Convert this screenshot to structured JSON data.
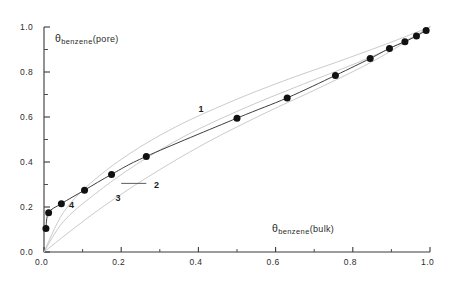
{
  "figure": {
    "background_color": "#ffffff",
    "axis_color": "#3a3a3a",
    "marker_color": "#111111",
    "data_curve_color": "#3d3d3d",
    "theory_curve_color": "#b9b9b9"
  },
  "labels": {
    "y_axis": {
      "theta": "θ",
      "subscript": "benzene",
      "paren": "(pore)"
    },
    "x_axis": {
      "theta": "θ",
      "subscript": "benzene",
      "paren": "(bulk)"
    }
  },
  "chart_data": {
    "type": "scatter",
    "title": "",
    "xlabel": "θ benzene (bulk)",
    "ylabel": "θ benzene (pore)",
    "xlim": [
      0.0,
      1.0
    ],
    "ylim": [
      0.0,
      1.0
    ],
    "grid": false,
    "legend": "none",
    "x_ticks": [
      0.0,
      0.2,
      0.4,
      0.6,
      0.8,
      1.0
    ],
    "x_tick_labels": [
      "0.0",
      "0.2",
      "0.4",
      "0.6",
      "0.8",
      "1.0"
    ],
    "y_ticks": [
      0.0,
      0.2,
      0.4,
      0.6,
      0.8,
      1.0
    ],
    "y_tick_labels": [
      "0.0",
      "0.2",
      "0.4",
      "0.6",
      "0.8",
      "1.0"
    ],
    "x_minor_ticks": [
      0.1,
      0.3,
      0.5,
      0.7,
      0.9
    ],
    "y_minor_ticks": [
      0.1,
      0.3,
      0.5,
      0.7,
      0.9
    ],
    "annotations": [
      {
        "text": "1",
        "x": 0.4,
        "y": 0.63
      },
      {
        "text": "2",
        "x": 0.285,
        "y": 0.295
      },
      {
        "text": "3",
        "x": 0.185,
        "y": 0.235
      },
      {
        "text": "4",
        "x": 0.065,
        "y": 0.205
      }
    ],
    "series": [
      {
        "name": "4",
        "label": "simulation data",
        "type": "scatter+line",
        "marker": "filled-circle",
        "points": [
          {
            "x": 0.005,
            "y": 0.105
          },
          {
            "x": 0.012,
            "y": 0.175
          },
          {
            "x": 0.045,
            "y": 0.215
          },
          {
            "x": 0.105,
            "y": 0.275
          },
          {
            "x": 0.175,
            "y": 0.345
          },
          {
            "x": 0.265,
            "y": 0.425
          },
          {
            "x": 0.5,
            "y": 0.595
          },
          {
            "x": 0.63,
            "y": 0.685
          },
          {
            "x": 0.755,
            "y": 0.785
          },
          {
            "x": 0.845,
            "y": 0.86
          },
          {
            "x": 0.895,
            "y": 0.905
          },
          {
            "x": 0.935,
            "y": 0.935
          },
          {
            "x": 0.965,
            "y": 0.96
          },
          {
            "x": 0.99,
            "y": 0.985
          }
        ]
      },
      {
        "name": "1",
        "label": "theory curve 1",
        "type": "line",
        "style": "faint",
        "points": [
          {
            "x": 0.0,
            "y": 0.0
          },
          {
            "x": 0.05,
            "y": 0.175
          },
          {
            "x": 0.12,
            "y": 0.305
          },
          {
            "x": 0.22,
            "y": 0.435
          },
          {
            "x": 0.34,
            "y": 0.555
          },
          {
            "x": 0.48,
            "y": 0.665
          },
          {
            "x": 0.62,
            "y": 0.76
          },
          {
            "x": 0.76,
            "y": 0.845
          },
          {
            "x": 0.88,
            "y": 0.92
          },
          {
            "x": 1.0,
            "y": 1.0
          }
        ]
      },
      {
        "name": "2",
        "label": "theory curve 2",
        "type": "line",
        "style": "faint",
        "points": [
          {
            "x": 0.0,
            "y": 0.0
          },
          {
            "x": 0.05,
            "y": 0.135
          },
          {
            "x": 0.13,
            "y": 0.255
          },
          {
            "x": 0.24,
            "y": 0.39
          },
          {
            "x": 0.37,
            "y": 0.52
          },
          {
            "x": 0.52,
            "y": 0.64
          },
          {
            "x": 0.67,
            "y": 0.745
          },
          {
            "x": 0.81,
            "y": 0.84
          },
          {
            "x": 0.92,
            "y": 0.925
          },
          {
            "x": 1.0,
            "y": 1.0
          }
        ]
      },
      {
        "name": "3",
        "label": "theory curve 3",
        "type": "line",
        "style": "faint",
        "points": [
          {
            "x": 0.0,
            "y": 0.0
          },
          {
            "x": 0.07,
            "y": 0.095
          },
          {
            "x": 0.16,
            "y": 0.21
          },
          {
            "x": 0.28,
            "y": 0.345
          },
          {
            "x": 0.42,
            "y": 0.485
          },
          {
            "x": 0.57,
            "y": 0.615
          },
          {
            "x": 0.72,
            "y": 0.735
          },
          {
            "x": 0.86,
            "y": 0.855
          },
          {
            "x": 1.0,
            "y": 1.0
          }
        ]
      }
    ]
  }
}
